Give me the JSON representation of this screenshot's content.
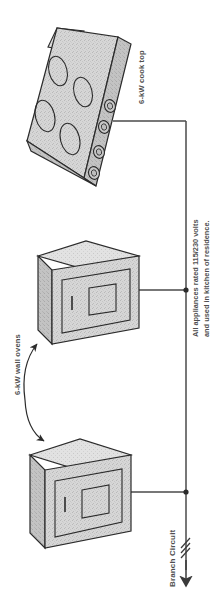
{
  "diagram": {
    "orientation": "rotated-90",
    "labels": {
      "cooktop": "6-kW cook top",
      "wall_ovens": "6-kW wall ovens",
      "branch_circuit": "Branch Circuit"
    },
    "note": {
      "line1": "All appliances rated 115/230 volts",
      "line2": "and used in kitchen of residence."
    },
    "appliances": [
      {
        "id": "cook-top",
        "name": "6-kW cook top",
        "rating_kw": 6,
        "burners": 4,
        "knobs": 4,
        "type": "cooktop"
      },
      {
        "id": "wall-oven-upper",
        "name": "6-kW wall oven",
        "rating_kw": 6,
        "type": "wall-oven"
      },
      {
        "id": "wall-oven-lower",
        "name": "6-kW wall oven",
        "rating_kw": 6,
        "type": "wall-oven"
      }
    ],
    "electrical": {
      "voltage": "115/230 volts",
      "conductor_marks": 3,
      "junction_dots": 2,
      "feeder_direction": "down"
    },
    "colors": {
      "body_fill": "#d4d4d4",
      "body_fill_light": "#dedede",
      "body_fill_dark": "#c2c2c2",
      "outline": "#2b2b2b",
      "wire": "#4a4a4a",
      "text": "#4f4f4f"
    }
  }
}
